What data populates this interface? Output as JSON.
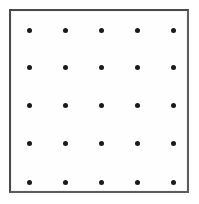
{
  "figure": {
    "canvas": {
      "width": 199,
      "height": 204,
      "background_color": "#ffffff"
    },
    "frame": {
      "name": "rectangular border",
      "x": 9,
      "y": 9,
      "width": 180,
      "height": 184,
      "border_color": "#4a4a4a",
      "border_width_px": 2,
      "fill_color": "#fefefe"
    },
    "lattice": {
      "type": "square-grid",
      "rows": 5,
      "columns": 5,
      "dot_count": 25,
      "dot_color": "#1a1a1a",
      "dot_diameter_px": 5,
      "column_spacing_px": 36,
      "row_spacing_px": 38,
      "column_centers_x": [
        29,
        65,
        101,
        137,
        173
      ],
      "row_centers_y": [
        30,
        67,
        105,
        143,
        182
      ]
    }
  },
  "chart_data": {
    "type": "scatter",
    "title": "",
    "xlabel": "",
    "ylabel": "",
    "grid": false,
    "legend": null,
    "xlim": [
      9,
      189
    ],
    "ylim": [
      9,
      193
    ],
    "marker": "filled-circle",
    "marker_color": "#1a1a1a",
    "marker_size_px": 5,
    "points": [
      {
        "x": 29,
        "y": 30
      },
      {
        "x": 65,
        "y": 30
      },
      {
        "x": 101,
        "y": 30
      },
      {
        "x": 137,
        "y": 30
      },
      {
        "x": 173,
        "y": 30
      },
      {
        "x": 29,
        "y": 67
      },
      {
        "x": 65,
        "y": 67
      },
      {
        "x": 101,
        "y": 67
      },
      {
        "x": 137,
        "y": 67
      },
      {
        "x": 173,
        "y": 67
      },
      {
        "x": 29,
        "y": 105
      },
      {
        "x": 65,
        "y": 105
      },
      {
        "x": 101,
        "y": 105
      },
      {
        "x": 137,
        "y": 105
      },
      {
        "x": 173,
        "y": 105
      },
      {
        "x": 29,
        "y": 143
      },
      {
        "x": 65,
        "y": 143
      },
      {
        "x": 101,
        "y": 143
      },
      {
        "x": 137,
        "y": 143
      },
      {
        "x": 173,
        "y": 143
      },
      {
        "x": 29,
        "y": 182
      },
      {
        "x": 65,
        "y": 182
      },
      {
        "x": 101,
        "y": 182
      },
      {
        "x": 137,
        "y": 182
      },
      {
        "x": 173,
        "y": 182
      }
    ]
  }
}
